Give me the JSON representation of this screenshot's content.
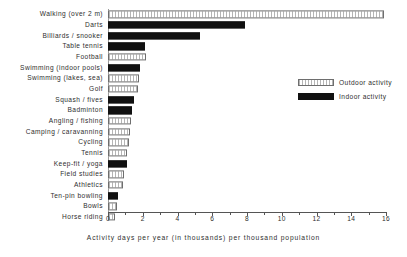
{
  "chart_data": {
    "type": "bar",
    "orientation": "horizontal",
    "title": "",
    "xlabel": "Activity days per year (in thousands) per thousand population",
    "ylabel": "",
    "xlim": [
      0,
      16
    ],
    "xticks": [
      0,
      1,
      2,
      3,
      4,
      5,
      6,
      7,
      8,
      9,
      10,
      11,
      12,
      13,
      14,
      15,
      16
    ],
    "xticklabels": [
      "0",
      "2",
      "4",
      "6",
      "8",
      "10",
      "12",
      "14",
      "16"
    ],
    "xticklabel_values": [
      0,
      2,
      4,
      6,
      8,
      10,
      12,
      14,
      16
    ],
    "grid": false,
    "legend_position": "right",
    "legend": [
      {
        "key": "outdoor",
        "label": "Outdoor activity"
      },
      {
        "key": "indoor",
        "label": "Indoor activity"
      }
    ],
    "categories": [
      "Walking (over 2 m)",
      "Darts",
      "Billiards / snooker",
      "Table tennis",
      "Football",
      "Swimming (indoor pools)",
      "Swimming (lakes, sea)",
      "Golf",
      "Squash / fives",
      "Badminton",
      "Angling / fishing",
      "Camping / caravanning",
      "Cycling",
      "Tennis",
      "Keep-fit / yoga",
      "Field studies",
      "Athletics",
      "Ten-pin bowling",
      "Bowls",
      "Horse riding"
    ],
    "values": [
      15.9,
      7.9,
      5.3,
      2.15,
      2.2,
      1.85,
      1.8,
      1.7,
      1.5,
      1.4,
      1.3,
      1.25,
      1.2,
      1.1,
      1.1,
      0.9,
      0.85,
      0.6,
      0.5,
      0.4
    ],
    "types": [
      "outdoor",
      "indoor",
      "indoor",
      "indoor",
      "outdoor",
      "indoor",
      "outdoor",
      "outdoor",
      "indoor",
      "indoor",
      "outdoor",
      "outdoor",
      "outdoor",
      "outdoor",
      "indoor",
      "outdoor",
      "outdoor",
      "indoor",
      "outdoor",
      "outdoor"
    ],
    "bars": [
      {
        "category": "Walking (over 2 m)",
        "value": 15.9,
        "type": "outdoor"
      },
      {
        "category": "Darts",
        "value": 7.9,
        "type": "indoor"
      },
      {
        "category": "Billiards / snooker",
        "value": 5.3,
        "type": "indoor"
      },
      {
        "category": "Table tennis",
        "value": 2.15,
        "type": "indoor"
      },
      {
        "category": "Football",
        "value": 2.2,
        "type": "outdoor"
      },
      {
        "category": "Swimming (indoor pools)",
        "value": 1.85,
        "type": "indoor"
      },
      {
        "category": "Swimming (lakes, sea)",
        "value": 1.8,
        "type": "outdoor"
      },
      {
        "category": "Golf",
        "value": 1.7,
        "type": "outdoor"
      },
      {
        "category": "Squash / fives",
        "value": 1.5,
        "type": "indoor"
      },
      {
        "category": "Badminton",
        "value": 1.4,
        "type": "indoor"
      },
      {
        "category": "Angling / fishing",
        "value": 1.3,
        "type": "outdoor"
      },
      {
        "category": "Camping / caravanning",
        "value": 1.25,
        "type": "outdoor"
      },
      {
        "category": "Cycling",
        "value": 1.2,
        "type": "outdoor"
      },
      {
        "category": "Tennis",
        "value": 1.1,
        "type": "outdoor"
      },
      {
        "category": "Keep-fit / yoga",
        "value": 1.1,
        "type": "indoor"
      },
      {
        "category": "Field studies",
        "value": 0.9,
        "type": "outdoor"
      },
      {
        "category": "Athletics",
        "value": 0.85,
        "type": "outdoor"
      },
      {
        "category": "Ten-pin bowling",
        "value": 0.6,
        "type": "indoor"
      },
      {
        "category": "Bowls",
        "value": 0.5,
        "type": "outdoor"
      },
      {
        "category": "Horse riding",
        "value": 0.4,
        "type": "outdoor"
      }
    ],
    "colors": {
      "indoor": "#111111",
      "outdoor": "#ffffff",
      "outdoor_edge": "#6e6e6e",
      "axis": "#555555",
      "text": "#2e2e2e"
    }
  }
}
